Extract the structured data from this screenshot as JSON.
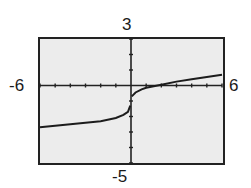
{
  "window": {
    "xmin": "-6",
    "xmax": "6",
    "ymin": "-5",
    "ymax": "3"
  },
  "colors": {
    "screen_bg": "#ececec",
    "frame": "#222222",
    "axis": "#222222",
    "curve": "#1c1c1c"
  },
  "chart_data": {
    "type": "line",
    "title": "",
    "xlabel": "",
    "ylabel": "",
    "xlim": [
      -6,
      6
    ],
    "ylim": [
      -5,
      3
    ],
    "xscale_tick": 1,
    "yscale_tick": 1,
    "grid": false,
    "legend": null,
    "series": [
      {
        "name": "left branch",
        "x": [
          -6,
          -5,
          -4,
          -3,
          -2,
          -1,
          -0.5,
          -0.2,
          -0.05
        ],
        "y": [
          -2.7,
          -2.6,
          -2.5,
          -2.4,
          -2.3,
          -2.1,
          -1.9,
          -1.7,
          -1.3
        ]
      },
      {
        "name": "right branch",
        "x": [
          0.05,
          0.3,
          0.7,
          1,
          2,
          3,
          4,
          5,
          6
        ],
        "y": [
          -0.7,
          -0.45,
          -0.25,
          -0.15,
          0.05,
          0.25,
          0.4,
          0.55,
          0.7
        ]
      }
    ]
  }
}
